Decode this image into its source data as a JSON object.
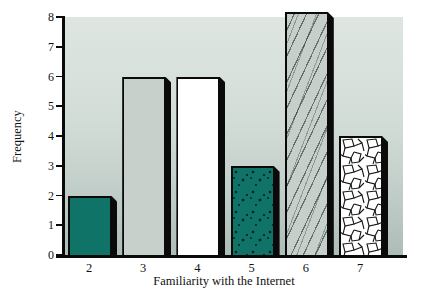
{
  "chart_data": {
    "type": "bar",
    "title": "",
    "xlabel": "Familiarity with the Internet",
    "ylabel": "Frequency",
    "categories": [
      "2",
      "3",
      "4",
      "5",
      "6",
      "7"
    ],
    "values": [
      2,
      6,
      6,
      3,
      8,
      4
    ],
    "ylim": [
      0,
      8
    ],
    "yticks": [
      0,
      1,
      2,
      3,
      4,
      5,
      6,
      7,
      8
    ],
    "grid": false,
    "legend": "none",
    "bar_styles": [
      "solid-teal",
      "solid-gray",
      "solid-white",
      "speckled-teal",
      "diagonal-hatch",
      "crackle-white"
    ],
    "colors": {
      "teal": "#0f7368",
      "plain_gray": "#c8d0cb",
      "white": "#ffffff",
      "outline": "#0a0a0a",
      "plot_bg_top": "#dfe6e1",
      "plot_bg_bottom": "#aebcb8"
    }
  }
}
